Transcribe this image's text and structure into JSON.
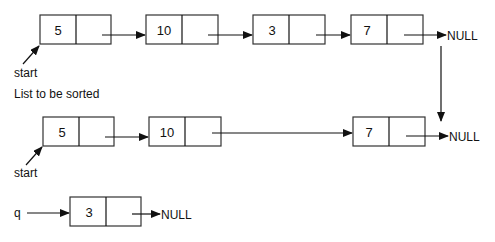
{
  "diagram": {
    "type": "linked-list-sort-illustration",
    "caption": "List to be sorted",
    "null_label": "NULL",
    "rows": [
      {
        "name": "original-list",
        "pointer_label": "start",
        "nodes": [
          {
            "value": "5"
          },
          {
            "value": "10"
          },
          {
            "value": "3"
          },
          {
            "value": "7"
          }
        ],
        "terminal": "NULL"
      },
      {
        "name": "list-after-removal",
        "pointer_label": "start",
        "nodes": [
          {
            "value": "5"
          },
          {
            "value": "10"
          },
          {
            "value": "7"
          }
        ],
        "terminal": "NULL"
      },
      {
        "name": "removed-node",
        "pointer_label": "q",
        "nodes": [
          {
            "value": "3"
          }
        ],
        "terminal": "NULL"
      }
    ]
  }
}
